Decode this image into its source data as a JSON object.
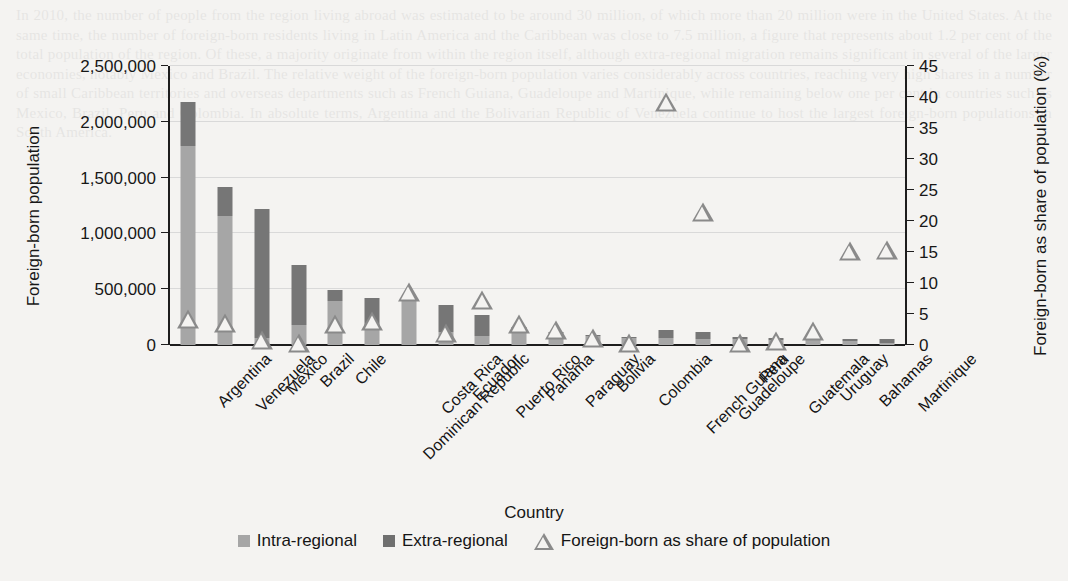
{
  "chart_data": {
    "type": "bar",
    "title": "",
    "xlabel": "Country",
    "ylabel": "Foreign-born population",
    "y2label": "Foreign-born as share of population (%)",
    "grid": true,
    "legend_position": "bottom",
    "ylim": [
      0,
      2500000
    ],
    "y2lim": [
      0,
      45
    ],
    "yticks": [
      0,
      500000,
      1000000,
      1500000,
      2000000,
      2500000
    ],
    "ytick_labels": [
      "0",
      "500,000",
      "1,000,000",
      "1,500,000",
      "2,000,000",
      "2,500,000"
    ],
    "y2ticks": [
      0,
      5,
      10,
      15,
      20,
      25,
      30,
      35,
      40,
      45
    ],
    "y2tick_labels": [
      "0",
      "5",
      "10",
      "15",
      "20",
      "25",
      "30",
      "35",
      "40",
      "45"
    ],
    "categories": [
      "Argentina",
      "Venezuela",
      "Mexico",
      "Brazil",
      "Chile",
      "Dominican Republic",
      "Costa Rica",
      "Ecuador",
      "Puerto Rico",
      "Panama",
      "Paraguay",
      "Bolivia",
      "Colombia",
      "French Guiana",
      "Guadeloupe",
      "Peru",
      "Guatemala",
      "Uruguay",
      "Bahamas",
      "Martinique"
    ],
    "series": [
      {
        "name": "Intra-regional",
        "color": "#a6a6a6",
        "axis": "left",
        "values": [
          1780000,
          1160000,
          60000,
          180000,
          395000,
          155000,
          400000,
          120000,
          80000,
          105000,
          105000,
          80000,
          60000,
          60000,
          55000,
          50000,
          45000,
          60000,
          35000,
          20000
        ]
      },
      {
        "name": "Extra-regional",
        "color": "#767676",
        "axis": "left",
        "values": [
          400000,
          260000,
          1160000,
          535000,
          100000,
          265000,
          25000,
          235000,
          190000,
          55000,
          15000,
          10000,
          10000,
          75000,
          60000,
          25000,
          20000,
          15000,
          20000,
          35000
        ]
      },
      {
        "name": "Foreign-born as share of population",
        "color": "#8a8a8a",
        "axis": "right",
        "marker": "triangle",
        "values": [
          4.2,
          3.5,
          0.8,
          0.3,
          3.4,
          3.9,
          8.6,
          1.9,
          7.2,
          3.4,
          2.4,
          1.1,
          0.4,
          39.2,
          21.5,
          0.3,
          0.6,
          2.2,
          15.2,
          15.3
        ]
      }
    ]
  },
  "legend": {
    "items": [
      {
        "label": "Intra-regional",
        "type": "swatch",
        "color": "#a6a6a6"
      },
      {
        "label": "Extra-regional",
        "type": "swatch",
        "color": "#6f6f6f"
      },
      {
        "label": "Foreign-born as share of population",
        "type": "triangle",
        "color": "#8a8a8a"
      }
    ]
  },
  "background_text": "In 2010, the number of people from the region living abroad was estimated to be around 30 million, of which more than 20 million were in the United States. At the same time, the number of foreign-born residents living in Latin America and the Caribbean was close to 7.5 million, a figure that represents about 1.2 per cent of the total population of the region. Of these, a majority originate from within the region itself, although extra-regional migration remains significant in several of the larger economies, notably Mexico and Brazil. The relative weight of the foreign-born population varies considerably across countries, reaching very high shares in a number of small Caribbean territories and overseas departments such as French Guiana, Guadeloupe and Martinique, while remaining below one per cent in countries such as Mexico, Brazil, Peru and Colombia. In absolute terms, Argentina and the Bolivarian Republic of Venezuela continue to host the largest foreign-born populations in South America."
}
